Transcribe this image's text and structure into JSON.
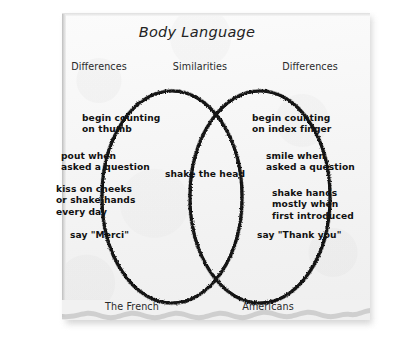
{
  "title": "Body Language",
  "headers": {
    "left": "Differences",
    "middle": "Similarities",
    "right": "Differences"
  },
  "footers": {
    "left": "The French",
    "right": "Americans"
  },
  "left_circle": {
    "label": "The French",
    "items": [
      "begin counting\non thumb",
      "pout when\nasked a question",
      "kiss on cheeks\nor shake hands\nevery day",
      "say \"Merci\""
    ]
  },
  "right_circle": {
    "label": "Americans",
    "items": [
      "begin counting\non index finger",
      "smile when\nasked a question",
      "shake hands\nmostly when\nfirst introduced",
      "say \"Thank you\""
    ]
  },
  "overlap": {
    "items": [
      "shake the head"
    ]
  },
  "colors": {
    "ink": "#111111",
    "paper": "#f4f4f4",
    "background": "#ffffff",
    "stroke": "#151515"
  }
}
